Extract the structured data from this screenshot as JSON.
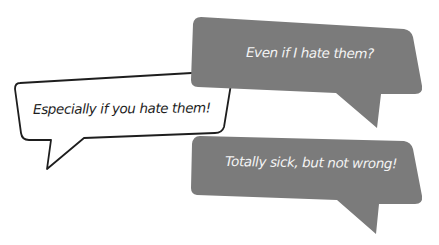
{
  "conversation": {
    "bubbles": [
      {
        "id": "top",
        "style": "filled-gray",
        "text": "Even if I hate them?",
        "tail_direction": "down"
      },
      {
        "id": "middle",
        "style": "outlined-white",
        "text": "Especially if you hate them!",
        "tail_direction": "down-left"
      },
      {
        "id": "bottom",
        "style": "filled-gray",
        "text": "Totally sick, but not wrong!",
        "tail_direction": "down"
      }
    ]
  },
  "colors": {
    "gray_fill": "#7b7b7b",
    "white_fill": "#ffffff",
    "outline": "#1e1e1e",
    "gray_text": "#f4f4f4",
    "dark_text": "#1e1e1e"
  }
}
